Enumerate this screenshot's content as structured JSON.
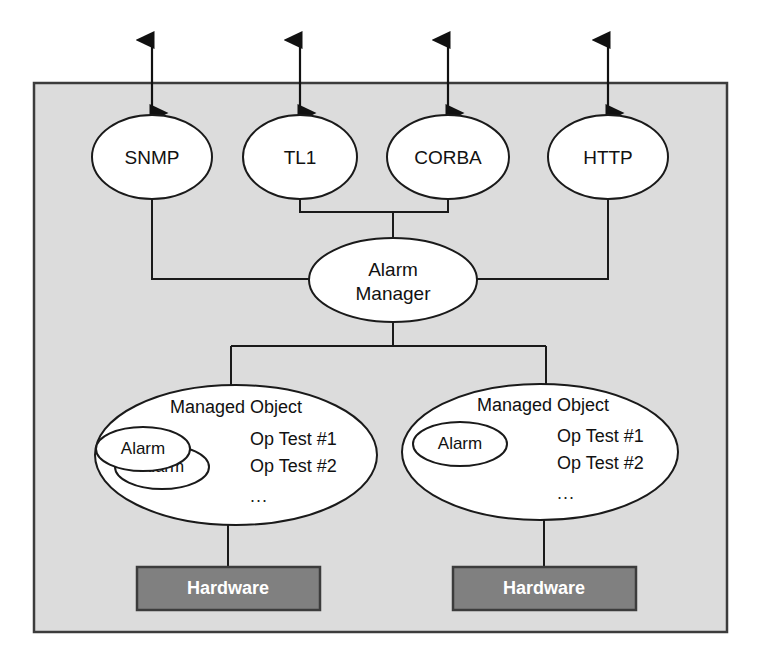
{
  "diagram": {
    "background_color": "#ffffff",
    "container_fill": "#dcdcdc",
    "container_stroke": "#3c3c3c",
    "node_fill": "#ffffff",
    "node_stroke": "#1a1a1a",
    "hardware_fill": "#808080",
    "hardware_text_color": "#ffffff"
  },
  "interfaces": [
    {
      "label": "SNMP",
      "arrow_label": "bidirectional"
    },
    {
      "label": "TL1",
      "arrow_label": "bidirectional"
    },
    {
      "label": "CORBA",
      "arrow_label": "bidirectional"
    },
    {
      "label": "HTTP",
      "arrow_label": "bidirectional"
    }
  ],
  "alarm_manager": {
    "line1": "Alarm",
    "line2": "Manager"
  },
  "managed_objects": [
    {
      "title": "Managed Object",
      "alarms": [
        "Alarm",
        "Alarm"
      ],
      "operations": [
        "Op Test #1",
        "Op Test #2"
      ],
      "more": "...",
      "hardware": "Hardware"
    },
    {
      "title": "Managed Object",
      "alarms": [
        "Alarm"
      ],
      "operations": [
        "Op Test #1",
        "Op Test #2"
      ],
      "more": "...",
      "hardware": "Hardware"
    }
  ]
}
